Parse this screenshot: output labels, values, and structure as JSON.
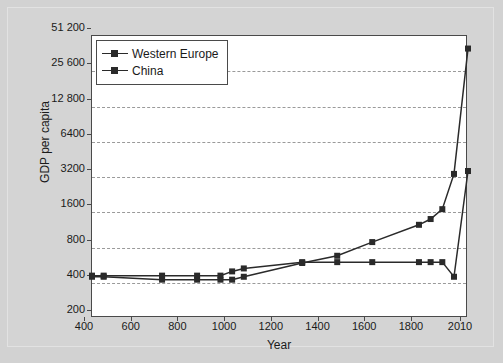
{
  "figure": {
    "background_color": "#d2d2d2",
    "plot_background_color": "#ffffff",
    "axis_color": "#4a4a4a",
    "grid_color": "#9a9a9a",
    "series_color": "#2a2a2a"
  },
  "chart_data": {
    "type": "line",
    "title": "",
    "xlabel": "Year",
    "ylabel": "GDP per capita",
    "xlim": [
      400,
      2010
    ],
    "ylim": [
      200,
      51200
    ],
    "yscale": "log2",
    "grid": true,
    "legend_position": "top-left",
    "xticks": [
      400,
      600,
      800,
      1000,
      1200,
      1400,
      1600,
      1800,
      2010
    ],
    "xtick_labels": [
      "400",
      "600",
      "800",
      "1000",
      "1200",
      "1400",
      "1600",
      "1800",
      "2010"
    ],
    "yticks": [
      200,
      400,
      800,
      1600,
      3200,
      6400,
      12800,
      25600,
      51200
    ],
    "ytick_labels": [
      "200",
      "400",
      "800",
      "1600",
      "3200",
      "6400",
      "12 800",
      "25 600",
      "51 200"
    ],
    "series": [
      {
        "name": "Western Europe",
        "marker": "square",
        "x": [
          400,
          450,
          700,
          850,
          950,
          1000,
          1050,
          1300,
          1450,
          1600,
          1800,
          1850,
          1900,
          1950,
          2010
        ],
        "y": [
          450,
          450,
          425,
          425,
          425,
          425,
          450,
          590,
          680,
          890,
          1250,
          1400,
          1700,
          3400,
          40000
        ]
      },
      {
        "name": "China",
        "marker": "square",
        "x": [
          400,
          450,
          700,
          850,
          950,
          1000,
          1050,
          1300,
          1450,
          1600,
          1800,
          1850,
          1900,
          1950,
          2010
        ],
        "y": [
          460,
          460,
          460,
          460,
          460,
          500,
          530,
          600,
          600,
          600,
          600,
          600,
          600,
          450,
          3600
        ]
      }
    ]
  },
  "legend": {
    "items": [
      {
        "label": "Western Europe"
      },
      {
        "label": "China"
      }
    ]
  }
}
